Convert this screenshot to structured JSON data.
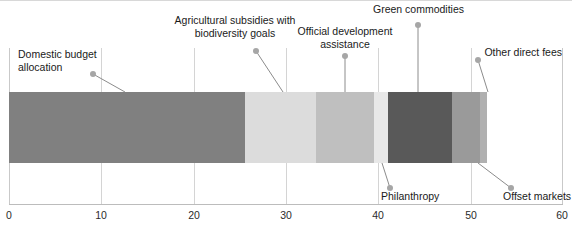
{
  "chart_data": {
    "type": "bar",
    "orientation": "horizontal",
    "stacked": true,
    "title": "",
    "subtitle": "",
    "xlabel": "",
    "ylabel": "",
    "xlim": [
      0,
      60
    ],
    "grid": true,
    "legend_position": "none",
    "xticks": [
      "0",
      "10",
      "20",
      "30",
      "40",
      "50",
      "60"
    ],
    "xtick_values": [
      0,
      10,
      20,
      30,
      40,
      50,
      60
    ],
    "categories": [
      "Total"
    ],
    "series": [
      {
        "name": "Domestic budget allocation",
        "values": [
          25.6
        ],
        "start": 0.0,
        "end": 25.6,
        "color": "#808080"
      },
      {
        "name": "Agricultural subsidies with biodiversity goals",
        "values": [
          7.7
        ],
        "start": 25.6,
        "end": 33.3,
        "color": "#dcdcdc"
      },
      {
        "name": "Official development assistance",
        "values": [
          6.2
        ],
        "start": 33.3,
        "end": 39.5,
        "color": "#bfbfbf"
      },
      {
        "name": "Philanthropy",
        "values": [
          1.5
        ],
        "start": 39.5,
        "end": 41.0,
        "color": "#e8e8e8"
      },
      {
        "name": "Green commodities",
        "values": [
          7.0
        ],
        "start": 41.0,
        "end": 48.0,
        "color": "#595959"
      },
      {
        "name": "Offset markets",
        "values": [
          3.0
        ],
        "start": 48.0,
        "end": 51.0,
        "color": "#9a9a9a"
      },
      {
        "name": "Other direct fees",
        "values": [
          0.8
        ],
        "start": 51.0,
        "end": 51.8,
        "color": "#b0b0b0"
      }
    ],
    "total": 51.8
  },
  "callouts": [
    {
      "label": "Domestic budget\nallocation",
      "series": "Domestic budget allocation"
    },
    {
      "label": "Agricultural subsidies with\nbiodiversity goals",
      "series": "Agricultural subsidies with biodiversity goals"
    },
    {
      "label": "Official development\nassistance",
      "series": "Official development assistance"
    },
    {
      "label": "Green commodities",
      "series": "Green commodities"
    },
    {
      "label": "Other direct fees",
      "series": "Other direct fees"
    },
    {
      "label": "Philanthropy",
      "series": "Philanthropy"
    },
    {
      "label": "Offset markets",
      "series": "Offset markets"
    }
  ],
  "axis": {
    "tick_0": "0",
    "tick_10": "10",
    "tick_20": "20",
    "tick_30": "30",
    "tick_40": "40",
    "tick_50": "50",
    "tick_60": "60"
  },
  "colors": {
    "gridline": "#d4d4d4",
    "axis": "#bcbcbc",
    "dot": "#a6a6a6",
    "leader": "#8c8c8c",
    "text": "#1a1a1a"
  }
}
